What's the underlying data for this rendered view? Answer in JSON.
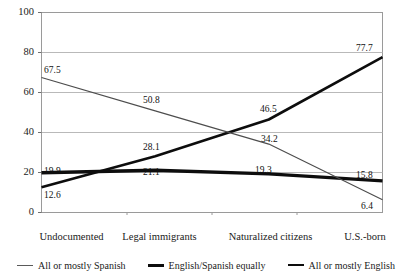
{
  "chart_data": {
    "type": "line",
    "title": "",
    "xlabel": "",
    "ylabel": "",
    "ylim": [
      0,
      100
    ],
    "yticks": [
      "0",
      "20",
      "40",
      "60",
      "80",
      "100"
    ],
    "grid": true,
    "legend_position": "bottom",
    "categories": [
      "Undocumented",
      "Legal immigrants",
      "Naturalized citizens",
      "U.S.-born"
    ],
    "series": [
      {
        "name": "All or mostly Spanish",
        "style": "thin",
        "color": "#4d4d4d",
        "values": [
          67.5,
          50.8,
          34.2,
          6.4
        ],
        "labels": [
          "67.5",
          "50.8",
          "34.2",
          "6.4"
        ]
      },
      {
        "name": "English/Spanish equally",
        "style": "medium",
        "color": "#0d0d0d",
        "values": [
          19.9,
          21.1,
          19.3,
          15.8
        ],
        "labels": [
          "19.9",
          "21.1",
          "19.3",
          "15.8"
        ]
      },
      {
        "name": "All or mostly English",
        "style": "bold",
        "color": "#0d0d0d",
        "values": [
          12.6,
          28.1,
          46.5,
          77.7
        ],
        "labels": [
          "12.6",
          "28.1",
          "46.5",
          "77.7"
        ]
      }
    ]
  },
  "axis": {
    "y": {
      "t0": "100",
      "t1": "80",
      "t2": "60",
      "t3": "40",
      "t4": "20",
      "t5": "0"
    },
    "x": {
      "c0": "Undocumented",
      "c1": "Legal immigrants",
      "c2": "Naturalized citizens",
      "c3": "U.S.-born"
    }
  },
  "labels": {
    "spanish": {
      "v0": "67.5",
      "v1": "50.8",
      "v2": "34.2",
      "v3": "6.4"
    },
    "equally": {
      "v0": "19.9",
      "v1": "21.1",
      "v2": "19.3",
      "v3": "15.8"
    },
    "english": {
      "v0": "12.6",
      "v1": "28.1",
      "v2": "46.5",
      "v3": "77.7"
    }
  },
  "legend": {
    "items": [
      {
        "label": "All or mostly Spanish",
        "icon": "line-thin-icon"
      },
      {
        "label": "English/Spanish equally",
        "icon": "line-medium-icon"
      },
      {
        "label": "All or mostly English",
        "icon": "line-bold-icon"
      }
    ]
  }
}
